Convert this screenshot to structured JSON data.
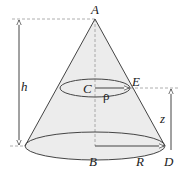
{
  "diagram": {
    "type": "cone-geometry",
    "labels": {
      "apex": "A",
      "base_center": "B",
      "section_center": "C",
      "base_edge": "D",
      "section_edge": "E",
      "height": "h",
      "section_height": "z",
      "base_radius": "R",
      "section_radius": "ρ"
    },
    "colors": {
      "stroke": "#444444",
      "fill": "#ececec",
      "dashed": "#999999"
    }
  }
}
